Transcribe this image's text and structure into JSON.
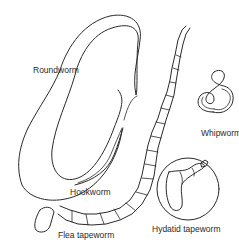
{
  "diagram": {
    "type": "illustration",
    "colors": {
      "line": "#2a2a2a",
      "background": "#ffffff"
    },
    "labels": {
      "roundworm": "Roundworm",
      "whipworm": "Whipworm",
      "hookworm": "Hookworm",
      "flea_tapeworm": "Flea tapeworm",
      "hydatid_tapeworm": "Hydatid tapeworm"
    }
  }
}
